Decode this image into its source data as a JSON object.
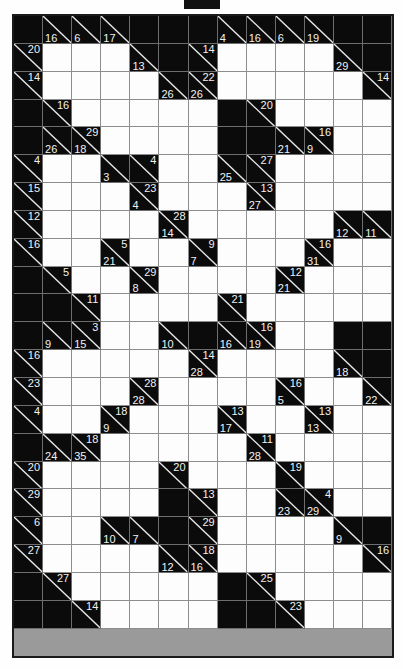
{
  "puzzle": {
    "type": "kakuro",
    "rows": 23,
    "cols": 13,
    "colors": {
      "block": "#0b0b0b",
      "open": "#fdfdfd",
      "grid_line": "#8d8d8d",
      "clue_text": "#f2f2f2"
    },
    "top_marker": true,
    "legend": {
      "across_label": "across",
      "down_label": "down"
    },
    "cells": [
      [
        {
          "t": "blk"
        },
        {
          "t": "clue",
          "down": "16"
        },
        {
          "t": "clue",
          "down": "6"
        },
        {
          "t": "clue",
          "down": "17"
        },
        {
          "t": "blk"
        },
        {
          "t": "blk"
        },
        {
          "t": "blk"
        },
        {
          "t": "clue",
          "down": "4"
        },
        {
          "t": "clue",
          "down": "16"
        },
        {
          "t": "clue",
          "down": "6"
        },
        {
          "t": "clue",
          "down": "19"
        },
        {
          "t": "blk"
        },
        {
          "t": "blk"
        }
      ],
      [
        {
          "t": "clue",
          "across": "20"
        },
        {
          "t": "open"
        },
        {
          "t": "open"
        },
        {
          "t": "open"
        },
        {
          "t": "clue",
          "down": "13"
        },
        {
          "t": "blk"
        },
        {
          "t": "clue",
          "across": "14"
        },
        {
          "t": "open"
        },
        {
          "t": "open"
        },
        {
          "t": "open"
        },
        {
          "t": "open"
        },
        {
          "t": "clue",
          "down": "29"
        },
        {
          "t": "blk"
        }
      ],
      [
        {
          "t": "clue",
          "across": "14"
        },
        {
          "t": "open"
        },
        {
          "t": "open"
        },
        {
          "t": "open"
        },
        {
          "t": "open"
        },
        {
          "t": "clue",
          "down": "26"
        },
        {
          "t": "clue",
          "down": "26",
          "across": "22"
        },
        {
          "t": "open"
        },
        {
          "t": "open"
        },
        {
          "t": "open"
        },
        {
          "t": "open"
        },
        {
          "t": "open"
        },
        {
          "t": "clue",
          "across": "14"
        }
      ],
      [
        {
          "t": "blk"
        },
        {
          "t": "clue",
          "across": "16"
        },
        {
          "t": "open"
        },
        {
          "t": "open"
        },
        {
          "t": "open"
        },
        {
          "t": "open"
        },
        {
          "t": "open"
        },
        {
          "t": "blk"
        },
        {
          "t": "clue",
          "across": "20"
        },
        {
          "t": "open"
        },
        {
          "t": "open"
        },
        {
          "t": "open"
        },
        {
          "t": "open"
        }
      ],
      [
        {
          "t": "blk"
        },
        {
          "t": "clue",
          "down": "26"
        },
        {
          "t": "clue",
          "down": "18",
          "across": "29"
        },
        {
          "t": "open"
        },
        {
          "t": "open"
        },
        {
          "t": "open"
        },
        {
          "t": "open"
        },
        {
          "t": "blk"
        },
        {
          "t": "blk"
        },
        {
          "t": "clue",
          "down": "21"
        },
        {
          "t": "clue",
          "down": "9",
          "across": "16"
        },
        {
          "t": "open"
        },
        {
          "t": "open"
        }
      ],
      [
        {
          "t": "clue",
          "across": "4"
        },
        {
          "t": "open"
        },
        {
          "t": "open"
        },
        {
          "t": "clue",
          "down": "3"
        },
        {
          "t": "clue",
          "across": "4"
        },
        {
          "t": "open"
        },
        {
          "t": "open"
        },
        {
          "t": "clue",
          "down": "25"
        },
        {
          "t": "clue",
          "across": "27"
        },
        {
          "t": "open"
        },
        {
          "t": "open"
        },
        {
          "t": "open"
        },
        {
          "t": "open"
        }
      ],
      [
        {
          "t": "clue",
          "across": "15"
        },
        {
          "t": "open"
        },
        {
          "t": "open"
        },
        {
          "t": "open"
        },
        {
          "t": "clue",
          "down": "4",
          "across": "23"
        },
        {
          "t": "open"
        },
        {
          "t": "open"
        },
        {
          "t": "open"
        },
        {
          "t": "clue",
          "down": "27",
          "across": "13"
        },
        {
          "t": "open"
        },
        {
          "t": "open"
        },
        {
          "t": "open"
        },
        {
          "t": "open"
        }
      ],
      [
        {
          "t": "clue",
          "across": "12"
        },
        {
          "t": "open"
        },
        {
          "t": "open"
        },
        {
          "t": "open"
        },
        {
          "t": "open"
        },
        {
          "t": "clue",
          "down": "14",
          "across": "28"
        },
        {
          "t": "open"
        },
        {
          "t": "open"
        },
        {
          "t": "open"
        },
        {
          "t": "open"
        },
        {
          "t": "open"
        },
        {
          "t": "clue",
          "down": "12"
        },
        {
          "t": "clue",
          "down": "11"
        }
      ],
      [
        {
          "t": "clue",
          "across": "16"
        },
        {
          "t": "open"
        },
        {
          "t": "open"
        },
        {
          "t": "clue",
          "down": "21",
          "across": "5"
        },
        {
          "t": "open"
        },
        {
          "t": "open"
        },
        {
          "t": "clue",
          "down": "7",
          "across": "9"
        },
        {
          "t": "open"
        },
        {
          "t": "open"
        },
        {
          "t": "open"
        },
        {
          "t": "clue",
          "down": "31",
          "across": "16"
        },
        {
          "t": "open"
        },
        {
          "t": "open"
        }
      ],
      [
        {
          "t": "blk"
        },
        {
          "t": "clue",
          "across": "5"
        },
        {
          "t": "open"
        },
        {
          "t": "open"
        },
        {
          "t": "clue",
          "down": "8",
          "across": "29"
        },
        {
          "t": "open"
        },
        {
          "t": "open"
        },
        {
          "t": "open"
        },
        {
          "t": "open"
        },
        {
          "t": "clue",
          "down": "21",
          "across": "12"
        },
        {
          "t": "open"
        },
        {
          "t": "open"
        },
        {
          "t": "open"
        }
      ],
      [
        {
          "t": "blk"
        },
        {
          "t": "blk"
        },
        {
          "t": "clue",
          "across": "11"
        },
        {
          "t": "open"
        },
        {
          "t": "open"
        },
        {
          "t": "open"
        },
        {
          "t": "open"
        },
        {
          "t": "clue",
          "across": "21"
        },
        {
          "t": "open"
        },
        {
          "t": "open"
        },
        {
          "t": "open"
        },
        {
          "t": "open"
        },
        {
          "t": "open"
        }
      ],
      [
        {
          "t": "blk"
        },
        {
          "t": "clue",
          "down": "9"
        },
        {
          "t": "clue",
          "down": "15",
          "across": "3"
        },
        {
          "t": "open"
        },
        {
          "t": "open"
        },
        {
          "t": "clue",
          "down": "10"
        },
        {
          "t": "blk"
        },
        {
          "t": "clue",
          "down": "16"
        },
        {
          "t": "clue",
          "down": "19",
          "across": "16"
        },
        {
          "t": "open"
        },
        {
          "t": "open"
        },
        {
          "t": "blk"
        },
        {
          "t": "blk"
        }
      ],
      [
        {
          "t": "clue",
          "across": "16"
        },
        {
          "t": "open"
        },
        {
          "t": "open"
        },
        {
          "t": "open"
        },
        {
          "t": "open"
        },
        {
          "t": "open"
        },
        {
          "t": "clue",
          "down": "28",
          "across": "14"
        },
        {
          "t": "open"
        },
        {
          "t": "open"
        },
        {
          "t": "open"
        },
        {
          "t": "open"
        },
        {
          "t": "clue",
          "down": "18"
        },
        {
          "t": "blk"
        }
      ],
      [
        {
          "t": "clue",
          "across": "23"
        },
        {
          "t": "open"
        },
        {
          "t": "open"
        },
        {
          "t": "open"
        },
        {
          "t": "clue",
          "down": "28",
          "across": "28"
        },
        {
          "t": "open"
        },
        {
          "t": "open"
        },
        {
          "t": "open"
        },
        {
          "t": "open"
        },
        {
          "t": "clue",
          "down": "5",
          "across": "16"
        },
        {
          "t": "open"
        },
        {
          "t": "open"
        },
        {
          "t": "clue",
          "down": "22"
        }
      ],
      [
        {
          "t": "clue",
          "across": "4"
        },
        {
          "t": "open"
        },
        {
          "t": "open"
        },
        {
          "t": "clue",
          "down": "9",
          "across": "18"
        },
        {
          "t": "open"
        },
        {
          "t": "open"
        },
        {
          "t": "open"
        },
        {
          "t": "clue",
          "down": "17",
          "across": "13"
        },
        {
          "t": "open"
        },
        {
          "t": "open"
        },
        {
          "t": "clue",
          "down": "13",
          "across": "13"
        },
        {
          "t": "open"
        },
        {
          "t": "open"
        }
      ],
      [
        {
          "t": "blk"
        },
        {
          "t": "clue",
          "down": "24"
        },
        {
          "t": "clue",
          "down": "35",
          "across": "18"
        },
        {
          "t": "open"
        },
        {
          "t": "open"
        },
        {
          "t": "open"
        },
        {
          "t": "open"
        },
        {
          "t": "open"
        },
        {
          "t": "clue",
          "down": "28",
          "across": "11"
        },
        {
          "t": "open"
        },
        {
          "t": "open"
        },
        {
          "t": "open"
        },
        {
          "t": "open"
        }
      ],
      [
        {
          "t": "clue",
          "across": "20"
        },
        {
          "t": "open"
        },
        {
          "t": "open"
        },
        {
          "t": "open"
        },
        {
          "t": "open"
        },
        {
          "t": "clue",
          "across": "20"
        },
        {
          "t": "open"
        },
        {
          "t": "open"
        },
        {
          "t": "open"
        },
        {
          "t": "clue",
          "across": "19"
        },
        {
          "t": "open"
        },
        {
          "t": "open"
        },
        {
          "t": "open"
        }
      ],
      [
        {
          "t": "clue",
          "across": "29"
        },
        {
          "t": "open"
        },
        {
          "t": "open"
        },
        {
          "t": "open"
        },
        {
          "t": "open"
        },
        {
          "t": "blk"
        },
        {
          "t": "clue",
          "across": "13"
        },
        {
          "t": "open"
        },
        {
          "t": "open"
        },
        {
          "t": "clue",
          "down": "23"
        },
        {
          "t": "clue",
          "down": "29",
          "across": "4"
        },
        {
          "t": "open"
        },
        {
          "t": "open"
        }
      ],
      [
        {
          "t": "clue",
          "across": "6"
        },
        {
          "t": "open"
        },
        {
          "t": "open"
        },
        {
          "t": "clue",
          "down": "10"
        },
        {
          "t": "clue",
          "down": "7"
        },
        {
          "t": "blk"
        },
        {
          "t": "clue",
          "across": "29"
        },
        {
          "t": "open"
        },
        {
          "t": "open"
        },
        {
          "t": "open"
        },
        {
          "t": "open"
        },
        {
          "t": "clue",
          "down": "9"
        },
        {
          "t": "blk"
        }
      ],
      [
        {
          "t": "clue",
          "across": "27"
        },
        {
          "t": "open"
        },
        {
          "t": "open"
        },
        {
          "t": "open"
        },
        {
          "t": "open"
        },
        {
          "t": "clue",
          "down": "12"
        },
        {
          "t": "clue",
          "down": "16",
          "across": "18"
        },
        {
          "t": "open"
        },
        {
          "t": "open"
        },
        {
          "t": "open"
        },
        {
          "t": "open"
        },
        {
          "t": "open"
        },
        {
          "t": "clue",
          "across": "16"
        }
      ],
      [
        {
          "t": "blk"
        },
        {
          "t": "clue",
          "across": "27"
        },
        {
          "t": "open"
        },
        {
          "t": "open"
        },
        {
          "t": "open"
        },
        {
          "t": "open"
        },
        {
          "t": "open"
        },
        {
          "t": "blk"
        },
        {
          "t": "clue",
          "across": "25"
        },
        {
          "t": "open"
        },
        {
          "t": "open"
        },
        {
          "t": "open"
        },
        {
          "t": "open"
        }
      ],
      [
        {
          "t": "blk"
        },
        {
          "t": "blk"
        },
        {
          "t": "clue",
          "across": "14"
        },
        {
          "t": "open"
        },
        {
          "t": "open"
        },
        {
          "t": "open"
        },
        {
          "t": "open"
        },
        {
          "t": "blk"
        },
        {
          "t": "blk"
        },
        {
          "t": "clue",
          "across": "23"
        },
        {
          "t": "open"
        },
        {
          "t": "open"
        },
        {
          "t": "open"
        }
      ]
    ]
  }
}
